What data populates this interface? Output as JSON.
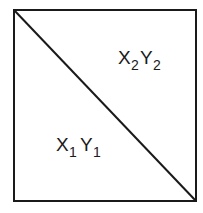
{
  "diagram": {
    "upper_region": {
      "x": "X",
      "x_sub": "2",
      "y": "Y",
      "y_sub": "2"
    },
    "lower_region": {
      "x": "X",
      "x_sub": "1",
      "y": "Y",
      "y_sub": "1"
    },
    "colors": {
      "line": "#1a1a1a",
      "background": "#ffffff"
    }
  }
}
